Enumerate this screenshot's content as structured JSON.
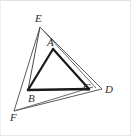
{
  "figure": {
    "background_color": "#ffffff",
    "border_color": "#e8e8e8",
    "width": 131,
    "height": 136,
    "inner_triangle": {
      "name": "triangle-abc",
      "stroke_color": "#1a1a1a",
      "stroke_width": 2.2,
      "vertices": [
        {
          "label": "A",
          "x": 52,
          "y": 48
        },
        {
          "label": "B",
          "x": 27,
          "y": 89
        },
        {
          "label": "C",
          "x": 88,
          "y": 88
        }
      ]
    },
    "outer_triangle": {
      "name": "triangle-def",
      "stroke_color": "#5a5a5a",
      "stroke_width": 1,
      "vertices": [
        {
          "label": "D",
          "x": 101,
          "y": 88
        },
        {
          "label": "E",
          "x": 39,
          "y": 26
        },
        {
          "label": "F",
          "x": 13,
          "y": 110
        }
      ]
    },
    "cevians": [
      {
        "name": "segment-e-to-b",
        "from": "E",
        "to": "B",
        "through": "A",
        "stroke_color": "#3c3c3c",
        "stroke_width": 1
      },
      {
        "name": "segment-e-to-d",
        "from": "E",
        "to": "D",
        "stroke_color": "#5a5a5a",
        "stroke_width": 1
      },
      {
        "name": "segment-f-to-d",
        "from": "F",
        "to": "D",
        "stroke_color": "#5a5a5a",
        "stroke_width": 1
      },
      {
        "name": "segment-f-to-e",
        "from": "F",
        "to": "E",
        "stroke_color": "#5a5a5a",
        "stroke_width": 1
      },
      {
        "name": "segment-f-to-c",
        "from": "F",
        "to": "C",
        "stroke_color": "#6a6a6a",
        "stroke_width": 1
      }
    ],
    "labels": {
      "A": {
        "text": "A",
        "x": 46,
        "y": 36
      },
      "B": {
        "text": "B",
        "x": 27,
        "y": 92
      },
      "C": {
        "text": "C",
        "x": 82,
        "y": 81
      },
      "D": {
        "text": "D",
        "x": 104,
        "y": 83
      },
      "E": {
        "text": "E",
        "x": 34,
        "y": 12
      },
      "F": {
        "text": "F",
        "x": 9,
        "y": 111
      }
    }
  }
}
